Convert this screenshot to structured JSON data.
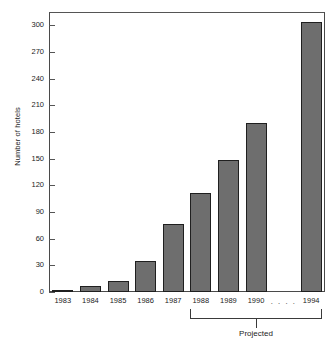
{
  "chart_data": {
    "type": "bar",
    "title": "",
    "title_remnant": "",
    "xlabel": "",
    "ylabel": "Number of hotels",
    "categories": [
      "1983",
      "1984",
      "1985",
      "1986",
      "1987",
      "1988",
      "1989",
      "1990",
      "1994"
    ],
    "values": [
      1,
      7,
      12,
      35,
      76,
      111,
      148,
      190,
      304
    ],
    "ylim": [
      0,
      315
    ],
    "y_ticks": [
      0,
      30,
      60,
      90,
      120,
      150,
      180,
      210,
      240,
      270,
      300
    ],
    "y_tick_labels": [
      "0",
      "30",
      "60",
      "90",
      "120",
      "150",
      "180",
      "210",
      "240",
      "270",
      "300"
    ],
    "gap_marker": ". . . .",
    "gap_after_category": "1990",
    "grid": false,
    "legend": null,
    "annotations": [
      {
        "name": "projected-bracket",
        "label": "Projected",
        "covers_categories": [
          "1988",
          "1989",
          "1990",
          "1994"
        ]
      }
    ],
    "colors": {
      "bar_fill": "#6e6e6e",
      "bar_outline": "#1f1f1f",
      "axis": "#4a4a4a",
      "text": "#1c1c1c",
      "background": "#ffffff"
    }
  },
  "axes": {
    "y_axis_title": "Number of hotels"
  },
  "bracket": {
    "label": "Projected"
  }
}
